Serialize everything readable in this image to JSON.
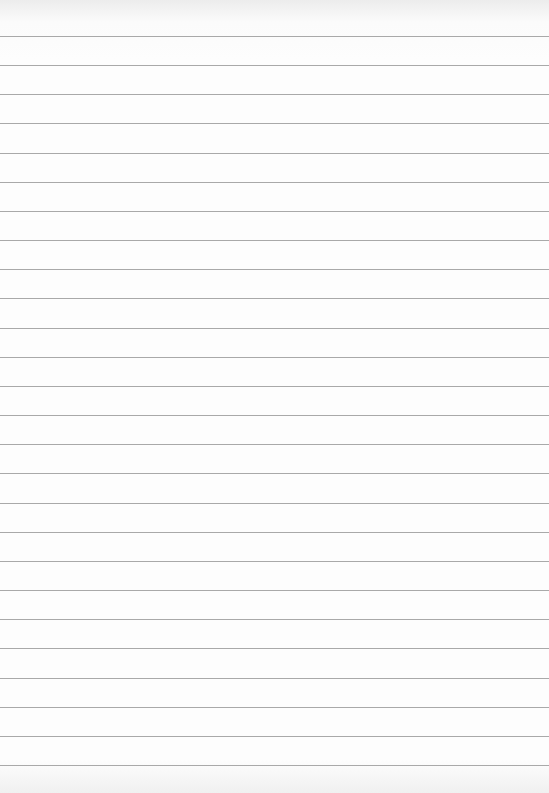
{
  "paper": {
    "type": "lined",
    "background": "#fdfdfd",
    "line_color": "#a9a9a9",
    "first_line_y": 36,
    "line_spacing": 29.16,
    "line_count": 26,
    "text_content": ""
  }
}
